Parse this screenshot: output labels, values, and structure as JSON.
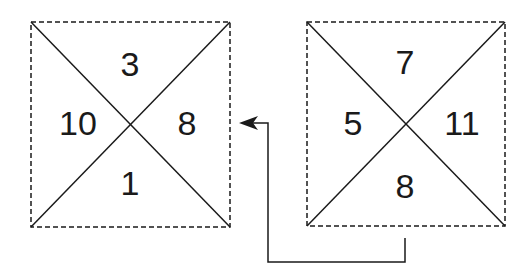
{
  "left_square": {
    "top": "3",
    "left": "10",
    "right": "8",
    "bottom": "1"
  },
  "right_square": {
    "top": "7",
    "left": "5",
    "right": "11",
    "bottom": "8"
  },
  "connector": {
    "direction": "right-square-to-left-square"
  },
  "colors": {
    "line": "#1a1a1a",
    "background": "#ffffff"
  }
}
